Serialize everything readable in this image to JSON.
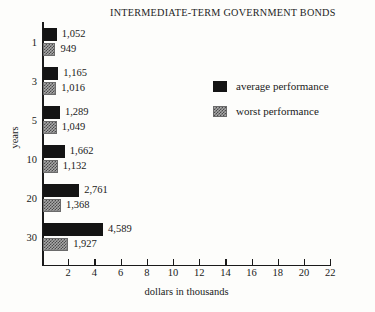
{
  "chart_data": {
    "type": "bar",
    "orientation": "horizontal",
    "title": "INTERMEDIATE-TERM GOVERNMENT BONDS",
    "xlabel": "dollars in thousands",
    "ylabel": "years",
    "xlim": [
      0,
      22
    ],
    "xticks": [
      2,
      4,
      6,
      8,
      10,
      12,
      14,
      16,
      18,
      20,
      22
    ],
    "xtick_labels": [
      "2",
      "4",
      "6",
      "8",
      "10",
      "12",
      "14",
      "16",
      "18",
      "20",
      "22"
    ],
    "grid": false,
    "legend_position": "upper right inside",
    "categories": [
      "1",
      "3",
      "5",
      "10",
      "20",
      "30"
    ],
    "series": [
      {
        "name": "average performance",
        "color": "#141414",
        "values": [
          1052,
          1165,
          1289,
          1662,
          2761,
          4589
        ],
        "value_labels": [
          "1,052",
          "1,165",
          "1,289",
          "1,662",
          "2,761",
          "4,589"
        ]
      },
      {
        "name": "worst performance",
        "color": "#a8a8a8",
        "values": [
          949,
          1016,
          1049,
          1132,
          1368,
          1927
        ],
        "value_labels": [
          "949",
          "1,016",
          "1,049",
          "1,132",
          "1,368",
          "1,927"
        ]
      }
    ]
  },
  "legend": {
    "entries": [
      {
        "label": "average performance",
        "swatch": "solid-black-swatch"
      },
      {
        "label": "worst performance",
        "swatch": "stippled-grey-swatch"
      }
    ]
  }
}
